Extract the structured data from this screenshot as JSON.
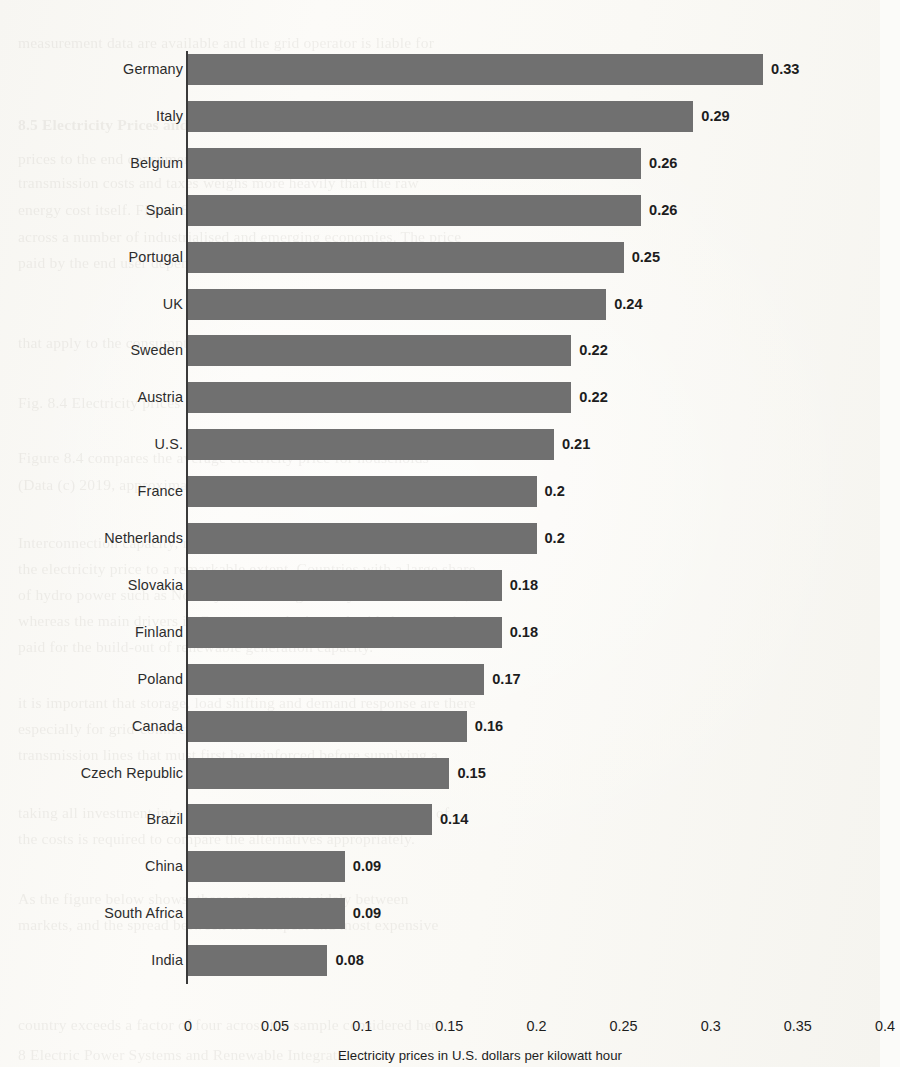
{
  "chart_data": {
    "type": "bar",
    "orientation": "horizontal",
    "title": "",
    "xlabel": "Electricity prices in U.S. dollars per kilowatt hour",
    "ylabel": "",
    "xlim": [
      0,
      0.4
    ],
    "xticks": [
      "0",
      "0.05",
      "0.1",
      "0.15",
      "0.2",
      "0.25",
      "0.3",
      "0.35",
      "0.4"
    ],
    "xtick_values": [
      0,
      0.05,
      0.1,
      0.15,
      0.2,
      0.25,
      0.3,
      0.35,
      0.4
    ],
    "grid": false,
    "legend": "none",
    "bar_color": "#707070",
    "categories": [
      "Germany",
      "Italy",
      "Belgium",
      "Spain",
      "Portugal",
      "UK",
      "Sweden",
      "Austria",
      "U.S.",
      "France",
      "Netherlands",
      "Slovakia",
      "Finland",
      "Poland",
      "Canada",
      "Czech Republic",
      "Brazil",
      "China",
      "South Africa",
      "India"
    ],
    "values": [
      0.33,
      0.29,
      0.26,
      0.26,
      0.25,
      0.24,
      0.22,
      0.22,
      0.21,
      0.2,
      0.2,
      0.18,
      0.18,
      0.17,
      0.16,
      0.15,
      0.14,
      0.09,
      0.09,
      0.08
    ],
    "value_labels": [
      "0.33",
      "0.29",
      "0.26",
      "0.26",
      "0.25",
      "0.24",
      "0.22",
      "0.22",
      "0.21",
      "0.2",
      "0.2",
      "0.18",
      "0.18",
      "0.17",
      "0.16",
      "0.15",
      "0.14",
      "0.09",
      "0.09",
      "0.08"
    ]
  },
  "page_bleed": {
    "lines": [
      {
        "text": "measurement data are available and the grid operator is liable for",
        "x": 18,
        "y": 30
      },
      {
        "text": "8.5  Electricity Prices and Tariffs",
        "x": 18,
        "y": 112,
        "bold": true
      },
      {
        "text": "prices to the end consumer. In many countries, the burden of",
        "x": 18,
        "y": 146
      },
      {
        "text": "transmission costs and taxes weighs more heavily than the raw",
        "x": 18,
        "y": 170
      },
      {
        "text": "energy cost itself. Figure 8.4 compares average retail prices",
        "x": 18,
        "y": 197
      },
      {
        "text": "across a number of industrialised and emerging economies. The price",
        "x": 18,
        "y": 224
      },
      {
        "text": "paid by the end user depends strongly on the national tax regime.",
        "x": 18,
        "y": 250
      },
      {
        "text": "that apply to the consumption of electrical energy",
        "x": 18,
        "y": 330
      },
      {
        "text": "Fig. 8.4  Electricity prices",
        "x": 18,
        "y": 390
      },
      {
        "text": "Figure 8.4 compares the average electricity price for households",
        "x": 18,
        "y": 445
      },
      {
        "text": "(Data (c) 2019, approximate figures, comparison across markets)",
        "x": 18,
        "y": 472
      },
      {
        "text": "Interconnection capacity, reserve margins and fuel mix all feed",
        "x": 18,
        "y": 530
      },
      {
        "text": "the electricity price to a remarkable extent. Countries with a large share",
        "x": 18,
        "y": 556
      },
      {
        "text": "of hydro power such as Norway or Canada generally have lower costs,",
        "x": 18,
        "y": 582
      },
      {
        "text": "whereas the main drivers in Germany are levies and grid charges to be",
        "x": 18,
        "y": 608
      },
      {
        "text": "paid for the build-out of renewable generation capacity.",
        "x": 18,
        "y": 634
      },
      {
        "text": "it is important that storage, load shifting and demand response are there",
        "x": 18,
        "y": 690
      },
      {
        "text": "especially for grid-connected systems which operate near the",
        "x": 18,
        "y": 716
      },
      {
        "text": "transmission lines that must first be reinforced before supplying a",
        "x": 18,
        "y": 742
      },
      {
        "text": "taking all investment into consideration, a full life cycle analysis of",
        "x": 18,
        "y": 800
      },
      {
        "text": "the costs is required to compare the alternatives appropriately.",
        "x": 18,
        "y": 826
      },
      {
        "text": "As the figure below shows, these prices vary widely between",
        "x": 18,
        "y": 886
      },
      {
        "text": "markets, and the spread between the cheapest and most expensive",
        "x": 18,
        "y": 912
      },
      {
        "text": "country exceeds a factor of four across the sample considered here.",
        "x": 18,
        "y": 1012
      },
      {
        "text": "8  Electric Power Systems and Renewable Integration",
        "x": 18,
        "y": 1042
      }
    ]
  },
  "geometry": {
    "x_zero_px": 148,
    "x_max_px": 845,
    "first_bar_top_px": 38,
    "bar_height_px": 31,
    "bar_pitch_px": 46.9,
    "axis_tick_row_y": 1002,
    "axis_title_y": 1032
  }
}
